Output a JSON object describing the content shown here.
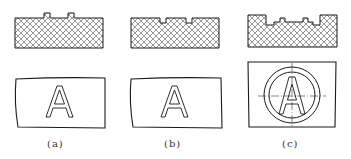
{
  "figure": {
    "panels": [
      {
        "id": "a",
        "label": "(a)",
        "section": "raised tabs (convex)",
        "letter": "A"
      },
      {
        "id": "b",
        "label": "(b)",
        "section": "grooves (concave)",
        "letter": "A"
      },
      {
        "id": "c",
        "label": "(c)",
        "section": "recessed pocket with raised rims",
        "letter": "A"
      }
    ],
    "colors": {
      "line": "#1a1a1a",
      "hatch": "#555555",
      "background": "#ffffff"
    }
  }
}
